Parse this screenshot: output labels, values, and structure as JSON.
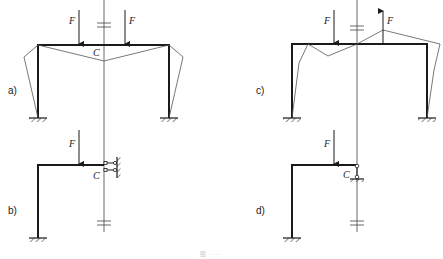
{
  "figure": {
    "caption": "图 ··· ···",
    "panels": [
      {
        "id": "a",
        "label": "a)",
        "description": "Symmetric portal frame with two downward loads F; deflected shape drawn; axis of symmetry through C",
        "force_label": "F",
        "point_label": "C",
        "loads": [
          "down",
          "down"
        ]
      },
      {
        "id": "b",
        "label": "b)",
        "description": "Half frame with downward load F; sliding (guided) support at C against wall",
        "force_label": "F",
        "point_label": "C",
        "loads": [
          "down"
        ]
      },
      {
        "id": "c",
        "label": "c)",
        "description": "Antisymmetric portal frame with one downward and one upward load F; deflected shape drawn",
        "force_label": "F",
        "point_label": "",
        "loads": [
          "down",
          "up"
        ]
      },
      {
        "id": "d",
        "label": "d)",
        "description": "Half frame with downward load F; roller support at C",
        "force_label": "F",
        "point_label": "C",
        "loads": [
          "down"
        ]
      }
    ]
  },
  "colors": {
    "member": "#1a1a1a",
    "deflection": "#555555",
    "background": "#ffffff"
  }
}
